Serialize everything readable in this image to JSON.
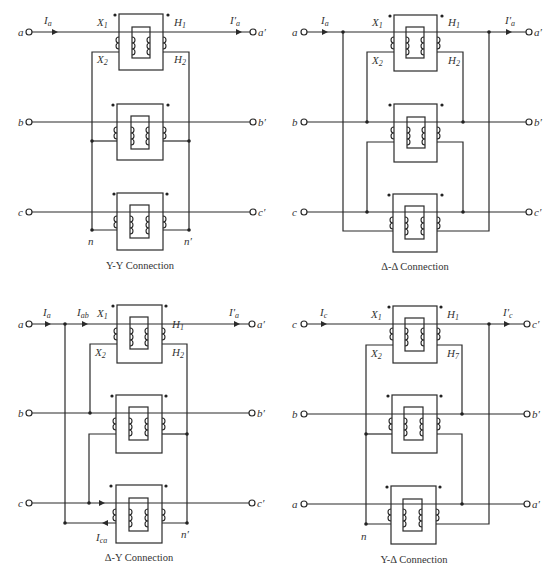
{
  "panels": [
    {
      "id": "yy",
      "caption": "Y-Y Connection",
      "ox": 0,
      "oy": 0,
      "inputs": [
        "a",
        "b",
        "c"
      ],
      "outputs": [
        "a′",
        "b′",
        "c′"
      ],
      "current_in": "I",
      "current_in_sub": "a",
      "current_out": "I′",
      "current_out_sub": "a",
      "winding_labels": {
        "x1": "X",
        "x1_sub": "1",
        "x2": "X",
        "x2_sub": "2",
        "h1": "H",
        "h1_sub": "1",
        "h2": "H",
        "h2_sub": "2"
      },
      "neutral_left": "n",
      "neutral_right": "n′"
    },
    {
      "id": "dd",
      "caption": "Δ-Δ Connection",
      "ox": 275,
      "oy": 0,
      "inputs": [
        "a",
        "b",
        "c"
      ],
      "outputs": [
        "a′",
        "b′",
        "c′"
      ],
      "current_in": "I",
      "current_in_sub": "a",
      "current_out": "I′",
      "current_out_sub": "a",
      "winding_labels": {
        "x1": "X",
        "x1_sub": "1",
        "x2": "X",
        "x2_sub": "2",
        "h1": "H",
        "h1_sub": "1",
        "h2": "H",
        "h2_sub": "2"
      }
    },
    {
      "id": "dy",
      "caption": "Δ-Y Connection",
      "ox": 0,
      "oy": 292,
      "inputs": [
        "a",
        "b",
        "c"
      ],
      "outputs": [
        "a′",
        "b′",
        "c′"
      ],
      "current_in": "I",
      "current_in_sub": "a",
      "current_mid": "I",
      "current_mid_sub": "ab",
      "current_out": "I′",
      "current_out_sub": "a",
      "current_return": "I",
      "current_return_sub": "ca",
      "winding_labels": {
        "x1": "X",
        "x1_sub": "1",
        "x2": "X",
        "x2_sub": "2",
        "h1": "H",
        "h1_sub": "1",
        "h2": "H",
        "h2_sub": "2"
      },
      "neutral_right": "n′"
    },
    {
      "id": "yd",
      "caption": "Y-Δ Connection",
      "ox": 275,
      "oy": 292,
      "inputs": [
        "c",
        "b",
        "a"
      ],
      "outputs": [
        "c′",
        "b′",
        "a′"
      ],
      "current_in": "I",
      "current_in_sub": "c",
      "current_out": "I′",
      "current_out_sub": "c",
      "winding_labels": {
        "x1": "X",
        "x1_sub": "1",
        "x2": "X",
        "x2_sub": "2",
        "h1": "H",
        "h1_sub": "1",
        "h2": "H",
        "h2_sub": "7"
      },
      "neutral_left": "n"
    }
  ],
  "colors": {
    "ink": "#2a2a2a",
    "background": "#ffffff"
  }
}
